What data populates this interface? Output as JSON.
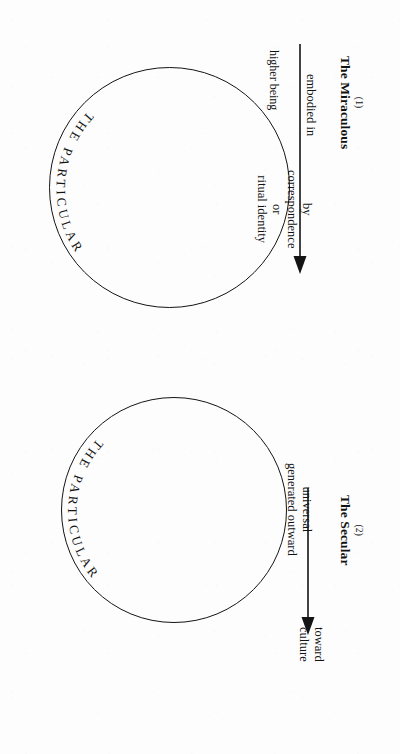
{
  "figure": {
    "orientation": "rotated-90-clockwise",
    "background_color": "#fdfdfd",
    "ink_color": "#141414"
  },
  "panels": [
    {
      "id": "miraculous",
      "number": "(1)",
      "title": "The Miraculous",
      "circle_caption": "THE PARTICULAR",
      "source_label": "higher being",
      "arrow_label": "embodied in",
      "inner_label_lines": [
        "by",
        "correspondence",
        "or",
        "ritual identity"
      ],
      "inner_label": "by correspondence or ritual identity"
    },
    {
      "id": "secular",
      "number": "(2)",
      "title": "The Secular",
      "circle_caption": "THE PARTICULAR",
      "arrow_label_lines": [
        "universal",
        "generated outward"
      ],
      "arrow_label": "universal generated outward",
      "target_label_lines": [
        "toward",
        "culture"
      ],
      "target_label": "toward culture"
    }
  ]
}
